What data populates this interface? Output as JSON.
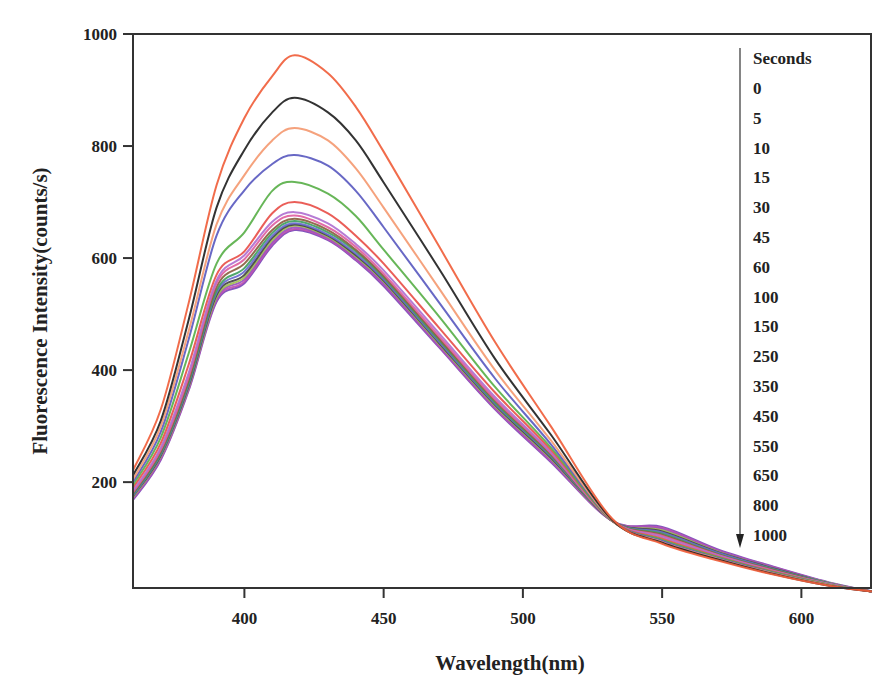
{
  "chart_data": {
    "type": "line",
    "title": "",
    "xlabel": "Wavelength(nm)",
    "ylabel": "Fluorescence Intensity(counts/s)",
    "xlim": [
      360,
      625
    ],
    "ylim": [
      11,
      1000
    ],
    "xticks": [
      400,
      450,
      500,
      550,
      600
    ],
    "yticks": [
      200,
      400,
      600,
      800,
      1000
    ],
    "grid": false,
    "legend_position": "upper right (inside)",
    "legend_title": "Seconds",
    "legend_arrow": "down",
    "x": [
      360,
      370,
      380,
      390,
      400,
      410,
      418,
      430,
      440,
      450,
      470,
      490,
      510,
      532,
      550,
      570,
      590,
      610,
      625
    ],
    "series": [
      {
        "name": "0",
        "color": "#f0603c",
        "values": [
          221,
          330,
          520,
          730,
          850,
          925,
          962,
          930,
          870,
          790,
          620,
          450,
          300,
          135,
          90,
          60,
          35,
          15,
          5
        ]
      },
      {
        "name": "5",
        "color": "#222222",
        "values": [
          212,
          310,
          490,
          690,
          793,
          860,
          886,
          860,
          810,
          735,
          580,
          420,
          285,
          133,
          92,
          62,
          36,
          15,
          5
        ]
      },
      {
        "name": "10",
        "color": "#f49a72",
        "values": [
          205,
          300,
          470,
          660,
          748,
          810,
          832,
          810,
          760,
          690,
          545,
          400,
          275,
          132,
          93,
          63,
          37,
          16,
          5
        ]
      },
      {
        "name": "15",
        "color": "#5b5bc0",
        "values": [
          200,
          290,
          455,
          640,
          721,
          768,
          784,
          765,
          720,
          655,
          520,
          385,
          268,
          132,
          95,
          64,
          38,
          16,
          5
        ]
      },
      {
        "name": "30",
        "color": "#5ab04a",
        "values": [
          195,
          280,
          430,
          590,
          646,
          720,
          736,
          715,
          675,
          615,
          495,
          370,
          262,
          131,
          97,
          66,
          39,
          17,
          5
        ]
      },
      {
        "name": "45",
        "color": "#e8504a",
        "values": [
          190,
          270,
          410,
          570,
          612,
          680,
          700,
          680,
          640,
          590,
          475,
          360,
          258,
          131,
          99,
          67,
          40,
          17,
          5
        ]
      },
      {
        "name": "60",
        "color": "#b070d0",
        "values": [
          185,
          262,
          395,
          560,
          605,
          665,
          682,
          662,
          625,
          578,
          465,
          352,
          254,
          131,
          102,
          69,
          41,
          18,
          5
        ]
      },
      {
        "name": "100",
        "color": "#e060a0",
        "values": [
          182,
          258,
          388,
          555,
          598,
          658,
          676,
          655,
          620,
          572,
          460,
          348,
          252,
          131,
          104,
          70,
          42,
          18,
          5
        ]
      },
      {
        "name": "150",
        "color": "#8a6040",
        "values": [
          180,
          255,
          382,
          548,
          590,
          650,
          670,
          650,
          615,
          568,
          456,
          345,
          250,
          131,
          106,
          71,
          43,
          18,
          5
        ]
      },
      {
        "name": "250",
        "color": "#40a060",
        "values": [
          178,
          252,
          378,
          542,
          582,
          645,
          666,
          646,
          612,
          565,
          453,
          342,
          248,
          131,
          108,
          72,
          44,
          19,
          5
        ]
      },
      {
        "name": "350",
        "color": "#6a6ad0",
        "values": [
          176,
          250,
          375,
          538,
          576,
          640,
          662,
          642,
          608,
          562,
          450,
          340,
          246,
          131,
          110,
          74,
          45,
          19,
          5
        ]
      },
      {
        "name": "450",
        "color": "#444444",
        "values": [
          175,
          248,
          372,
          534,
          570,
          636,
          660,
          640,
          605,
          560,
          448,
          338,
          244,
          131,
          112,
          75,
          46,
          19,
          5
        ]
      },
      {
        "name": "550",
        "color": "#a0c050",
        "values": [
          173,
          246,
          370,
          530,
          566,
          632,
          658,
          638,
          603,
          558,
          446,
          336,
          242,
          131,
          114,
          76,
          46,
          20,
          5
        ]
      },
      {
        "name": "650",
        "color": "#9a50c0",
        "values": [
          172,
          244,
          368,
          528,
          562,
          628,
          655,
          636,
          600,
          555,
          444,
          334,
          240,
          131,
          116,
          77,
          47,
          20,
          5
        ]
      },
      {
        "name": "800",
        "color": "#c050b0",
        "values": [
          170,
          242,
          366,
          525,
          558,
          625,
          652,
          634,
          598,
          553,
          442,
          332,
          238,
          131,
          118,
          78,
          48,
          20,
          5
        ]
      },
      {
        "name": "1000",
        "color": "#7a48b8",
        "values": [
          168,
          240,
          364,
          522,
          555,
          622,
          650,
          632,
          596,
          550,
          440,
          330,
          236,
          131,
          120,
          80,
          49,
          21,
          5
        ]
      }
    ]
  }
}
